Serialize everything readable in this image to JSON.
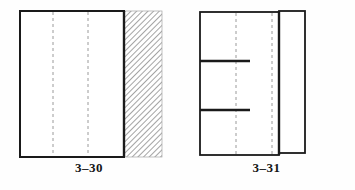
{
  "sheet": {
    "background_color": "#fefefe",
    "ink_color": "#1a1a1a",
    "hidden_line_color": "#9a9a9a",
    "hatch_color": "#8d8d8d"
  },
  "figures": [
    {
      "caption": "3–30",
      "kind": "orthographic-section-view",
      "outline": {
        "x": 20,
        "y": 11,
        "width": 104,
        "height": 146
      },
      "hidden_lines": [
        {
          "x": 53,
          "y1": 11,
          "y2": 157
        },
        {
          "x": 88,
          "y1": 11,
          "y2": 157
        }
      ],
      "hatch_region": {
        "x": 124,
        "y": 11,
        "width": 38,
        "height": 146,
        "angle": 45
      }
    },
    {
      "caption": "3–31",
      "kind": "orthographic-section-view",
      "outline": {
        "x": 200,
        "y": 12,
        "width": 79,
        "height": 143
      },
      "side_panel": {
        "x": 279,
        "y": 11,
        "width": 26,
        "height": 142
      },
      "hidden_lines": [
        {
          "x": 236,
          "y1": 12,
          "y2": 155
        },
        {
          "x": 272,
          "y1": 12,
          "y2": 155
        }
      ],
      "internal_edges": [
        {
          "x1": 200,
          "x2": 250,
          "y": 61
        },
        {
          "x1": 200,
          "x2": 250,
          "y": 110
        }
      ]
    }
  ]
}
